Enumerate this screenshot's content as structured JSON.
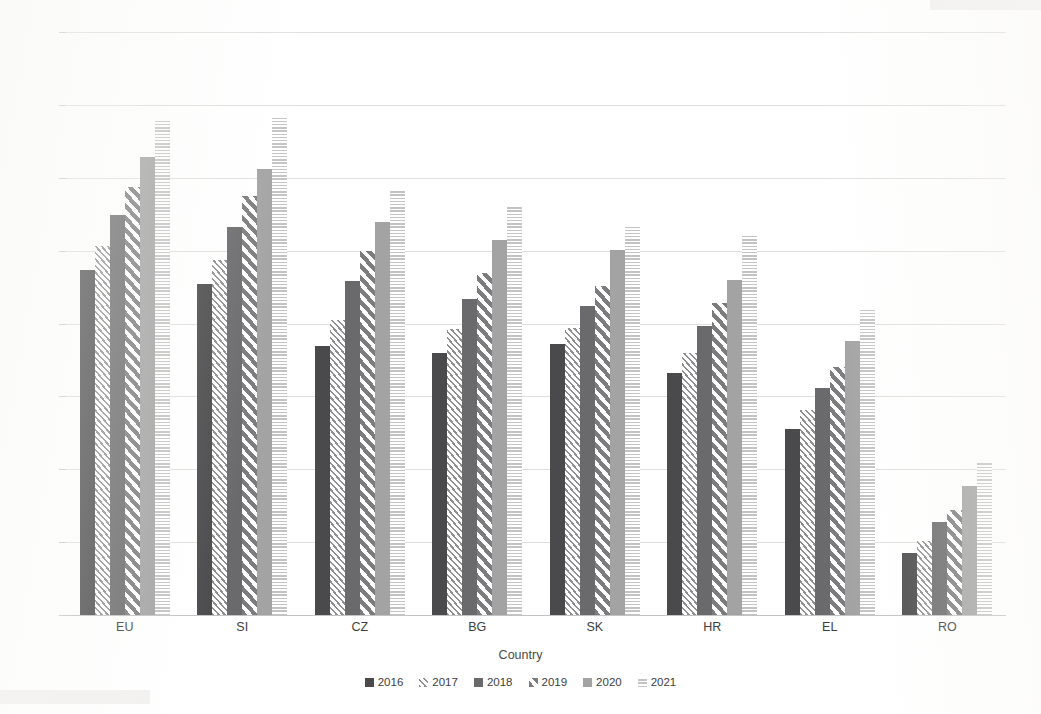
{
  "chart_data": {
    "type": "bar",
    "title": "",
    "xlabel": "Country",
    "ylabel": "DESI composite index",
    "categories": [
      "EU",
      "SI",
      "CZ",
      "BG",
      "SK",
      "HR",
      "EL",
      "RO"
    ],
    "ylim": [
      0,
      80
    ],
    "yticks": [
      0,
      10,
      20,
      30,
      40,
      50,
      60,
      70,
      80
    ],
    "grid": true,
    "legend_position": "bottom",
    "series": [
      {
        "name": "2016",
        "color": "#4a4a4c",
        "pattern": "solid-dark",
        "values": [
          47.3,
          45.4,
          36.9,
          35.9,
          37.2,
          33.2,
          25.5,
          8.5
        ]
      },
      {
        "name": "2017",
        "color": "#8f8f90",
        "pattern": "fine-diagonal",
        "values": [
          50.7,
          48.7,
          40.5,
          39.2,
          39.4,
          36.0,
          28.2,
          10.1
        ]
      },
      {
        "name": "2018",
        "color": "#6a6a6c",
        "pattern": "solid-medium",
        "values": [
          54.9,
          53.3,
          45.8,
          43.4,
          42.4,
          39.6,
          31.1,
          12.7
        ]
      },
      {
        "name": "2019",
        "color": "#7c7c7e",
        "pattern": "bold-diagonal",
        "values": [
          58.8,
          57.5,
          50.0,
          47.0,
          45.2,
          42.8,
          34.0,
          14.4
        ]
      },
      {
        "name": "2020",
        "color": "#a3a3a3",
        "pattern": "solid-light",
        "values": [
          62.9,
          61.2,
          53.9,
          51.4,
          50.1,
          46.0,
          37.6,
          17.7
        ]
      },
      {
        "name": "2021",
        "color": "#c3c3c3",
        "pattern": "fine-horizontal",
        "values": [
          68.1,
          68.2,
          58.4,
          56.0,
          53.2,
          52.0,
          41.8,
          21.0
        ]
      }
    ]
  },
  "legend": {
    "items": [
      {
        "label": "2016"
      },
      {
        "label": "2017"
      },
      {
        "label": "2018"
      },
      {
        "label": "2019"
      },
      {
        "label": "2020"
      },
      {
        "label": "2021"
      }
    ]
  }
}
